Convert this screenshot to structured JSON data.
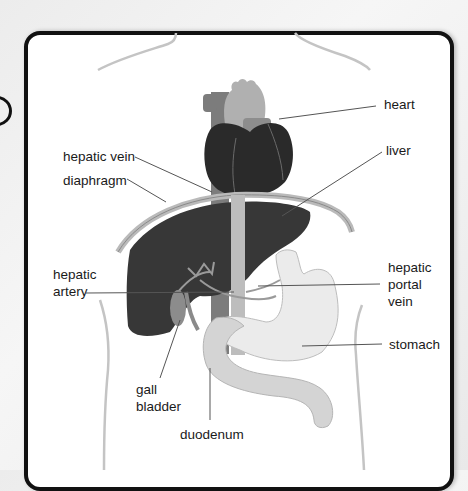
{
  "diagram": {
    "colors": {
      "heart": "#2b2b2b",
      "liver": "#3a3a3a",
      "vessel_light": "#b8b8b8",
      "vessel_mid": "#8a8a8a",
      "stomach": "#e6e6e6",
      "duodenum": "#d2d2d2",
      "gall_bladder": "#8c8c8c",
      "frame_border": "#111111",
      "leader_line": "#555555"
    },
    "labels": {
      "heart": "heart",
      "liver": "liver",
      "hepatic_vein": "hepatic vein",
      "diaphragm": "diaphragm",
      "hepatic_artery_line1": "hepatic",
      "hepatic_artery_line2": "artery",
      "hepatic_portal_vein_line1": "hepatic",
      "hepatic_portal_vein_line2": "portal",
      "hepatic_portal_vein_line3": "vein",
      "stomach": "stomach",
      "gall_bladder_line1": "gall",
      "gall_bladder_line2": "bladder",
      "duodenum": "duodenum"
    }
  }
}
